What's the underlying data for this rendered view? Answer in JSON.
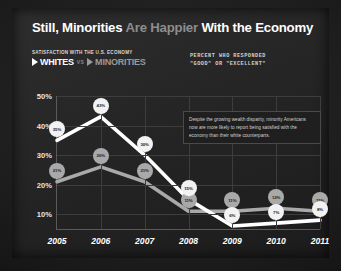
{
  "headline": {
    "part1": "Still, Minorities ",
    "part2": "Are Happier ",
    "part3": "With the Economy"
  },
  "legend": {
    "kicker": "SATISFACTION WITH THE U.S. ECONOMY",
    "series_whites": "WHITES",
    "vs": "VS",
    "series_minorities": "MINORITIES",
    "note_line1": "PERCENT WHO RESPONDED",
    "note_line2": "\"GOOD\" OR \"EXCELLENT\""
  },
  "annotation": {
    "text": "Despite the growing wealth disparity, minority Americans now are more likely to report being satisfied with the economy than their white counterparts."
  },
  "colors": {
    "whites_line": "#ffffff",
    "minorities_line": "#a9a9a9",
    "background": "#262626",
    "grid": "#3d3d3d",
    "headline_accent": "#8d8d8d"
  },
  "chart_data": {
    "type": "line",
    "title": "Still, Minorities Are Happier With the Economy",
    "subtitle": "Satisfaction with the U.S. economy",
    "xlabel": "",
    "ylabel": "Percent who responded \"good\" or \"excellent\"",
    "categories": [
      "2005",
      "2006",
      "2007",
      "2008",
      "2009",
      "2010",
      "2011"
    ],
    "x": [
      2005,
      2006,
      2007,
      2008,
      2009,
      2010,
      2011
    ],
    "ylim": [
      5,
      50
    ],
    "yticks": [
      10,
      20,
      30,
      40,
      50
    ],
    "ytick_labels": [
      "10%",
      "20%",
      "30%",
      "40%",
      "50%"
    ],
    "grid": true,
    "legend_position": "top-left",
    "series": [
      {
        "name": "WHITES",
        "color": "#ffffff",
        "values": [
          35,
          43,
          30,
          15,
          6,
          7,
          8
        ],
        "point_labels": [
          "35%",
          "43%",
          "30%",
          "15%",
          "6%",
          "7%",
          "8%"
        ]
      },
      {
        "name": "MINORITIES",
        "color": "#a9a9a9",
        "values": [
          21,
          26,
          21,
          11,
          11,
          12,
          11
        ],
        "point_labels": [
          "21%",
          "26%",
          "21%",
          "11%",
          "11%",
          "12%",
          "11%"
        ]
      }
    ],
    "annotations": [
      "Despite the growing wealth disparity, minority Americans now are more likely to report being satisfied with the economy than their white counterparts."
    ]
  }
}
